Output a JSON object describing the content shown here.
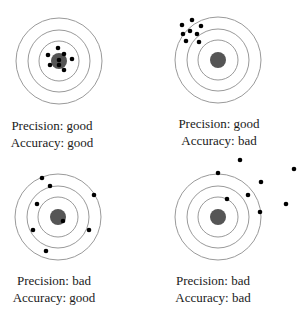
{
  "panels": [
    {
      "id": "precise-accurate",
      "precision_label": "Precision: good",
      "accuracy_label": "Accuracy: good",
      "center": [
        59,
        61
      ],
      "ring_radii": [
        43,
        31,
        20
      ],
      "bull_radius": 8,
      "label_x": 52,
      "label_y1": 118,
      "label_y2": 135,
      "shots": [
        [
          58,
          48
        ],
        [
          48,
          55
        ],
        [
          64,
          54
        ],
        [
          72,
          59
        ],
        [
          50,
          65
        ],
        [
          59,
          65
        ],
        [
          64,
          70
        ],
        [
          59,
          60
        ]
      ]
    },
    {
      "id": "precise-inaccurate",
      "precision_label": "Precision: good",
      "accuracy_label": "Accuracy: bad",
      "center": [
        218,
        60
      ],
      "ring_radii": [
        43,
        31,
        20
      ],
      "bull_radius": 8,
      "label_x": 219,
      "label_y1": 116,
      "label_y2": 133,
      "shots": [
        [
          182,
          25
        ],
        [
          192,
          20
        ],
        [
          201,
          26
        ],
        [
          183,
          34
        ],
        [
          190,
          31
        ],
        [
          197,
          34
        ],
        [
          186,
          41
        ],
        [
          199,
          42
        ]
      ]
    },
    {
      "id": "imprecise-accurate",
      "precision_label": "Precision: bad",
      "accuracy_label": "Accuracy: good",
      "center": [
        58,
        217
      ],
      "ring_radii": [
        43,
        31,
        20
      ],
      "bull_radius": 8,
      "label_x": 54,
      "label_y1": 273,
      "label_y2": 290,
      "shots": [
        [
          42,
          178
        ],
        [
          50,
          186
        ],
        [
          94,
          195
        ],
        [
          37,
          204
        ],
        [
          63,
          221
        ],
        [
          33,
          230
        ],
        [
          89,
          230
        ],
        [
          46,
          251
        ]
      ]
    },
    {
      "id": "imprecise-inaccurate",
      "precision_label": "Precision: bad",
      "accuracy_label": "Accuracy: bad",
      "center": [
        218,
        217
      ],
      "ring_radii": [
        43,
        31,
        20
      ],
      "bull_radius": 8,
      "label_x": 213,
      "label_y1": 273,
      "label_y2": 290,
      "shots": [
        [
          240,
          160
        ],
        [
          294,
          169
        ],
        [
          218,
          173
        ],
        [
          261,
          182
        ],
        [
          248,
          195
        ],
        [
          227,
          199
        ],
        [
          286,
          204
        ],
        [
          260,
          212
        ]
      ]
    }
  ],
  "colors": {
    "ring": "#9a9a9a",
    "bull": "#555555",
    "shot": "#000000",
    "text": "#1a1a1a"
  }
}
